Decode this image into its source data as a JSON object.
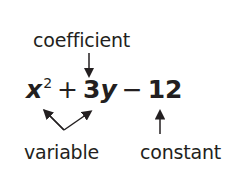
{
  "labels": {
    "coefficient": "coefficient",
    "variable": "variable",
    "constant": "constant"
  },
  "expression": {
    "term1_var": "x",
    "term1_exp": "2",
    "op1": "+",
    "term2_coef": "3",
    "term2_var": "y",
    "op2": "−",
    "constant": "12"
  }
}
